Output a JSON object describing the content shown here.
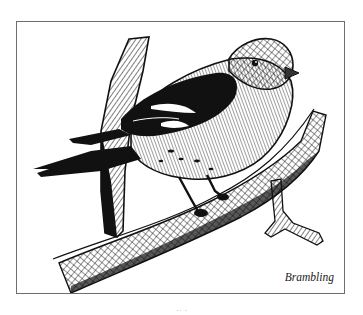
{
  "figure": {
    "caption": "Brambling",
    "frame_color": "#6e6e6e",
    "ink_color": "#111111",
    "background": "#ffffff"
  },
  "page": {
    "number_partial": "·· ·"
  }
}
